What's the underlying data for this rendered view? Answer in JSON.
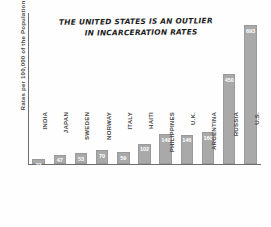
{
  "chart_data": {
    "type": "bar",
    "title": "THE UNITED STATES IS AN OUTLIER IN INCARCERATION RATES",
    "title_line1": "THE UNITED STATES IS AN OUTLIER",
    "title_line2": "IN INCARCERATION RATES",
    "xlabel": "",
    "ylabel": "Rates per 100,000 of the Population",
    "ylim": [
      0,
      760
    ],
    "grid": false,
    "legend": false,
    "bar_color": "#a9a9a9",
    "value_label_color": "#ffffff",
    "axis_color": "#6e6e6e",
    "categories": [
      "INDIA",
      "JAPAN",
      "SWEDEN",
      "NORWAY",
      "ITALY",
      "HAITI",
      "PHILIPPINES",
      "U.K.",
      "ARGENTINA",
      "RUSSIA",
      "U.S."
    ],
    "values": [
      23,
      47,
      53,
      70,
      59,
      102,
      149,
      146,
      160,
      450,
      693
    ],
    "value_labels": [
      "23",
      "47",
      "53",
      "70",
      "59",
      "102",
      "149",
      "146",
      "160",
      "450",
      "693"
    ]
  }
}
